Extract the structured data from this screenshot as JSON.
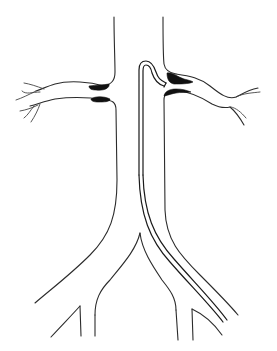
{
  "diagram": {
    "colors": {
      "background": "#ffffff",
      "line": "#2b2b2b",
      "plaque": "#111111"
    },
    "parts": [
      {
        "name": "aorta"
      },
      {
        "name": "left-renal-artery"
      },
      {
        "name": "right-renal-artery"
      },
      {
        "name": "left-ostial-plaque"
      },
      {
        "name": "right-ostial-plaque"
      },
      {
        "name": "catheter"
      },
      {
        "name": "iliac-bifurcation"
      }
    ]
  }
}
